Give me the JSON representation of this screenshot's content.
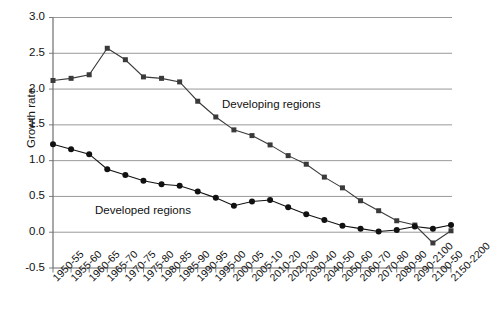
{
  "chart_data": {
    "type": "line",
    "title": "",
    "xlabel": "",
    "ylabel": "Growth rate",
    "ylim": [
      -0.5,
      3.0
    ],
    "yticks": [
      3.0,
      2.5,
      2.0,
      1.5,
      1.0,
      0.5,
      0.0,
      -0.5
    ],
    "ytick_labels": [
      "3.0",
      "2.5",
      "2.0",
      "1.5",
      "1.0",
      "0.5",
      "0.0",
      "-0.5"
    ],
    "grid": true,
    "grid_axis": "y",
    "legend": "inline-annotations",
    "categories": [
      "1950-55",
      "1955-60",
      "1960-65",
      "1965-70",
      "1970-75",
      "1975-80",
      "1980-85",
      "1985-90",
      "1990-95",
      "1995-00",
      "2000-05",
      "2005-10",
      "2010-20",
      "2020-30",
      "2030-40",
      "2040-50",
      "2050-60",
      "2060-70",
      "2070-80",
      "2080-90",
      "2090-2100",
      "2100-50",
      "2150-2200"
    ],
    "series": [
      {
        "name": "Developing regions",
        "marker": "square",
        "color": "#3a3a3a",
        "values": [
          2.12,
          2.15,
          2.2,
          2.57,
          2.41,
          2.17,
          2.15,
          2.1,
          1.83,
          1.61,
          1.43,
          1.35,
          1.22,
          1.07,
          0.95,
          0.77,
          0.62,
          0.44,
          0.3,
          0.16,
          0.1,
          -0.15,
          0.02
        ]
      },
      {
        "name": "Developed regions",
        "marker": "circle",
        "color": "#111111",
        "values": [
          1.23,
          1.16,
          1.09,
          0.88,
          0.8,
          0.72,
          0.67,
          0.65,
          0.57,
          0.48,
          0.37,
          0.43,
          0.45,
          0.35,
          0.25,
          0.17,
          0.09,
          0.05,
          0.01,
          0.03,
          0.08,
          0.05,
          0.1
        ]
      }
    ],
    "annotations": [
      {
        "text": "Developing regions",
        "x_px": 222,
        "y_px": 98
      },
      {
        "text": "Developed regions",
        "x_px": 95,
        "y_px": 204
      }
    ]
  },
  "axis": {
    "y_title": "Growth rate"
  }
}
